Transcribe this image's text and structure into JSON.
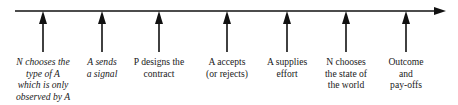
{
  "timeline": {
    "axis": {
      "x_start": 15,
      "x_end": 446,
      "y": 11,
      "color": "#111111"
    },
    "events": [
      {
        "x": 43,
        "lines": [
          "N chooses the",
          "type of A",
          "which is only",
          "observed by A"
        ],
        "italic": true
      },
      {
        "x": 102,
        "lines": [
          "A sends",
          "a signal"
        ],
        "italic": true
      },
      {
        "x": 159,
        "lines": [
          "P designs the",
          "contract"
        ],
        "italic": false
      },
      {
        "x": 227,
        "lines": [
          "A accepts",
          "(or rejects)"
        ],
        "italic": false
      },
      {
        "x": 287,
        "lines": [
          "A supplies",
          "effort"
        ],
        "italic": false
      },
      {
        "x": 346,
        "lines": [
          "N chooses",
          "the state of",
          "the world"
        ],
        "italic": false
      },
      {
        "x": 406,
        "lines": [
          "Outcome",
          "and",
          "pay-offs"
        ],
        "italic": false
      }
    ]
  }
}
